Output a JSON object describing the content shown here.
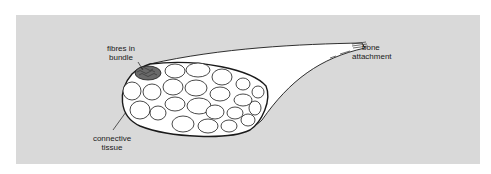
{
  "figure": {
    "type": "muscle cross-section diagram",
    "labels": {
      "fibres_in_bundle": {
        "line1": "fibres in",
        "line2": "bundle"
      },
      "bone_attachment": {
        "line1": "bone",
        "line2": "attachment"
      },
      "connective_tissue": {
        "line1": "connective",
        "line2": "tissue"
      }
    },
    "colors": {
      "panel_background": "#d9d9d9",
      "outline": "#1a1a1a",
      "fill": "#ffffff"
    }
  }
}
